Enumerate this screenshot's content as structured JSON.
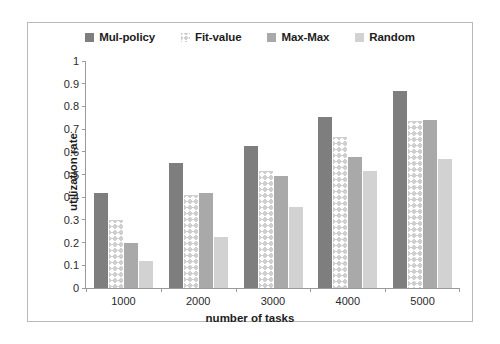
{
  "chart_data": {
    "type": "bar",
    "title": "",
    "xlabel": "number of tasks",
    "ylabel": "utilization  rate",
    "categories": [
      "1000",
      "2000",
      "3000",
      "4000",
      "5000"
    ],
    "ylim": [
      0,
      1
    ],
    "yticks": [
      "0",
      "0.1",
      "0.2",
      "0.3",
      "0.4",
      "0.5",
      "0.6",
      "0.7",
      "0.8",
      "0.9",
      "1"
    ],
    "grid": false,
    "legend_position": "top-center",
    "series": [
      {
        "name": "Mul-policy",
        "color": "#7e7e7e",
        "swatch": "solid-dark-gray",
        "values": [
          0.42,
          0.55,
          0.625,
          0.755,
          0.87
        ]
      },
      {
        "name": "Fit-value",
        "color": "#cfcfcf",
        "swatch": "cross-hatch-light",
        "values": [
          0.3,
          0.41,
          0.515,
          0.665,
          0.735
        ]
      },
      {
        "name": "Max-Max",
        "color": "#a9a9a9",
        "swatch": "solid-medium-gray",
        "values": [
          0.2,
          0.42,
          0.495,
          0.575,
          0.74
        ]
      },
      {
        "name": "Random",
        "color": "#d2d2d2",
        "swatch": "solid-light-gray",
        "values": [
          0.12,
          0.225,
          0.355,
          0.515,
          0.57
        ]
      }
    ]
  }
}
